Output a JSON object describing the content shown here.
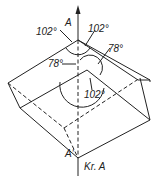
{
  "figure": {
    "axis_top_label": "A",
    "axis_bottom_label": "A'",
    "axis_caption": "Kr. A",
    "angles": {
      "top_left": "102°",
      "top_right": "102°",
      "right_mid": "78°",
      "left_mid": "78°",
      "bottom": "102°"
    }
  }
}
